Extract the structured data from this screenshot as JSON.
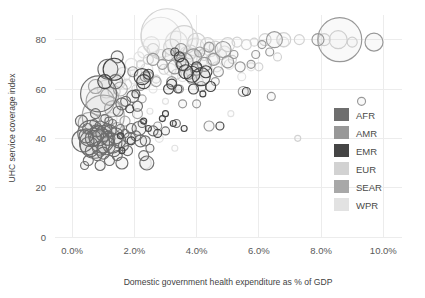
{
  "chart_data": {
    "type": "scatter",
    "title": "",
    "xlabel": "Domestic government health expenditure as % of GDP",
    "ylabel": "UHC service coverage index",
    "xlim": [
      -0.55,
      10.6
    ],
    "ylim": [
      0,
      90
    ],
    "xticks": [
      "0.0%",
      "2.0%",
      "4.0%",
      "6.0%",
      "8.0%",
      "10.0%"
    ],
    "xtick_values": [
      0,
      2,
      4,
      6,
      8,
      10
    ],
    "yticks": [
      "0",
      "20",
      "40",
      "60",
      "80"
    ],
    "ytick_values": [
      0,
      20,
      40,
      60,
      80
    ],
    "grid": true,
    "legend_position": "right-inside",
    "bubble_encoding": "population",
    "legend": [
      {
        "name": "AFR",
        "color": "#6e6e6e"
      },
      {
        "name": "AMR",
        "color": "#989898"
      },
      {
        "name": "EMR",
        "color": "#454545"
      },
      {
        "name": "EUR",
        "color": "#d2d2d2"
      },
      {
        "name": "SEAR",
        "color": "#a8a8a8"
      },
      {
        "name": "WPR",
        "color": "#e2e2e2"
      }
    ],
    "series": [
      {
        "name": "AFR",
        "color": "#6e6e6e",
        "points": [
          [
            0.35,
            39,
            11
          ],
          [
            0.45,
            41,
            7
          ],
          [
            0.5,
            44,
            5
          ],
          [
            0.55,
            37,
            9
          ],
          [
            0.6,
            42,
            13
          ],
          [
            0.62,
            35,
            6
          ],
          [
            0.68,
            40,
            8
          ],
          [
            0.7,
            46,
            4
          ],
          [
            0.72,
            38,
            15
          ],
          [
            0.78,
            43,
            6
          ],
          [
            0.8,
            33,
            5
          ],
          [
            0.85,
            41,
            10
          ],
          [
            0.88,
            36,
            7
          ],
          [
            0.9,
            45,
            5
          ],
          [
            0.95,
            39,
            12
          ],
          [
            1.0,
            34,
            6
          ],
          [
            1.02,
            42,
            8
          ],
          [
            1.05,
            48,
            4
          ],
          [
            1.1,
            37,
            9
          ],
          [
            1.12,
            44,
            5
          ],
          [
            1.15,
            40,
            7
          ],
          [
            1.2,
            31,
            5
          ],
          [
            1.22,
            43,
            6
          ],
          [
            1.28,
            38,
            10
          ],
          [
            1.3,
            46,
            4
          ],
          [
            1.35,
            35,
            6
          ],
          [
            1.4,
            41,
            8
          ],
          [
            1.45,
            33,
            5
          ],
          [
            1.5,
            39,
            7
          ],
          [
            1.55,
            44,
            4
          ],
          [
            1.6,
            30,
            6
          ],
          [
            1.65,
            37,
            5
          ],
          [
            1.7,
            42,
            4
          ],
          [
            1.78,
            35,
            5
          ],
          [
            1.85,
            40,
            6
          ],
          [
            0.4,
            29,
            4
          ],
          [
            0.52,
            31,
            5
          ],
          [
            0.9,
            29,
            5
          ],
          [
            1.18,
            47,
            4
          ],
          [
            0.3,
            47,
            6
          ],
          [
            0.75,
            50,
            5
          ],
          [
            1.48,
            51,
            5
          ],
          [
            1.6,
            54,
            6
          ],
          [
            1.72,
            55,
            5
          ],
          [
            1.9,
            44,
            5
          ],
          [
            2.05,
            41,
            5
          ],
          [
            2.15,
            44,
            7
          ],
          [
            2.2,
            39,
            6
          ],
          [
            2.25,
            46,
            4
          ],
          [
            2.3,
            33,
            5
          ],
          [
            2.4,
            30,
            7
          ],
          [
            2.1,
            53,
            5
          ],
          [
            1.95,
            57,
            6
          ],
          [
            1.4,
            63,
            7
          ],
          [
            0.85,
            58,
            18
          ],
          [
            1.15,
            68,
            10
          ],
          [
            1.45,
            73,
            6
          ],
          [
            2.6,
            43,
            5
          ],
          [
            3.0,
            43,
            4
          ],
          [
            3.35,
            46,
            4
          ],
          [
            2.35,
            39,
            5
          ],
          [
            2.5,
            36,
            4
          ]
        ]
      },
      {
        "name": "AMR",
        "color": "#989898",
        "points": [
          [
            2.6,
            72,
            6
          ],
          [
            2.9,
            70,
            5
          ],
          [
            3.1,
            74,
            6
          ],
          [
            3.3,
            69,
            7
          ],
          [
            3.5,
            76,
            6
          ],
          [
            3.6,
            71,
            9
          ],
          [
            3.75,
            66,
            5
          ],
          [
            3.9,
            73,
            8
          ],
          [
            4.0,
            68,
            6
          ],
          [
            4.1,
            75,
            5
          ],
          [
            4.25,
            70,
            7
          ],
          [
            4.4,
            77,
            5
          ],
          [
            4.55,
            72,
            6
          ],
          [
            4.7,
            67,
            5
          ],
          [
            4.85,
            76,
            8
          ],
          [
            5.0,
            71,
            6
          ],
          [
            5.2,
            74,
            4
          ],
          [
            5.4,
            69,
            5
          ],
          [
            2.35,
            65,
            5
          ],
          [
            2.2,
            61,
            4
          ],
          [
            3.2,
            63,
            5
          ],
          [
            3.45,
            60,
            4
          ],
          [
            4.6,
            63,
            4
          ],
          [
            4.15,
            61,
            5
          ],
          [
            6.5,
            80,
            8
          ],
          [
            7.9,
            80,
            6
          ],
          [
            8.6,
            80,
            22
          ],
          [
            9.7,
            79,
            9
          ],
          [
            6.1,
            78,
            4
          ],
          [
            5.9,
            74,
            4
          ],
          [
            6.35,
            75,
            4
          ],
          [
            5.75,
            70,
            4
          ],
          [
            1.95,
            67,
            5
          ],
          [
            2.75,
            45,
            4
          ],
          [
            3.55,
            54,
            4
          ],
          [
            4.4,
            45,
            5
          ],
          [
            4.0,
            54,
            4
          ],
          [
            5.5,
            59,
            5
          ],
          [
            6.4,
            57,
            4
          ],
          [
            9.3,
            55,
            4
          ]
        ]
      },
      {
        "name": "EMR",
        "color": "#454545",
        "points": [
          [
            1.05,
            63,
            7
          ],
          [
            1.35,
            68,
            11
          ],
          [
            2.25,
            65,
            8
          ],
          [
            2.3,
            63,
            7
          ],
          [
            2.45,
            66,
            5
          ],
          [
            3.3,
            75,
            4
          ],
          [
            3.45,
            73,
            5
          ],
          [
            3.55,
            70,
            6
          ],
          [
            3.65,
            67,
            7
          ],
          [
            3.85,
            66,
            8
          ],
          [
            4.0,
            69,
            5
          ],
          [
            4.15,
            65,
            9
          ],
          [
            4.3,
            67,
            6
          ],
          [
            3.2,
            62,
            5
          ],
          [
            3.1,
            60,
            5
          ],
          [
            3.4,
            60,
            4
          ],
          [
            2.05,
            58,
            4
          ],
          [
            1.85,
            52,
            4
          ],
          [
            2.3,
            47,
            3
          ],
          [
            2.45,
            44,
            3
          ],
          [
            3.25,
            46,
            3
          ],
          [
            2.75,
            42,
            4
          ],
          [
            4.75,
            45,
            4
          ],
          [
            5.6,
            59,
            4
          ],
          [
            3.0,
            50,
            3
          ],
          [
            1.55,
            41,
            3
          ],
          [
            1.9,
            39,
            4
          ],
          [
            1.6,
            35,
            3
          ],
          [
            4.45,
            61,
            5
          ],
          [
            4.2,
            58,
            3
          ],
          [
            3.9,
            60,
            5
          ],
          [
            2.9,
            48,
            3
          ],
          [
            3.6,
            44,
            3
          ]
        ]
      },
      {
        "name": "EUR",
        "color": "#d2d2d2",
        "points": [
          [
            3.05,
            82,
            26
          ],
          [
            3.6,
            80,
            14
          ],
          [
            4.0,
            79,
            9
          ],
          [
            4.35,
            78,
            7
          ],
          [
            4.6,
            77,
            6
          ],
          [
            5.0,
            78,
            7
          ],
          [
            5.3,
            79,
            5
          ],
          [
            5.6,
            78,
            5
          ],
          [
            5.85,
            79,
            4
          ],
          [
            6.2,
            80,
            6
          ],
          [
            6.8,
            80,
            7
          ],
          [
            7.3,
            80,
            5
          ],
          [
            8.1,
            80,
            6
          ],
          [
            8.55,
            80,
            9
          ],
          [
            9.0,
            79,
            5
          ],
          [
            2.6,
            76,
            6
          ],
          [
            2.85,
            74,
            5
          ],
          [
            3.2,
            77,
            8
          ],
          [
            3.4,
            73,
            6
          ],
          [
            4.8,
            74,
            5
          ],
          [
            4.5,
            72,
            6
          ],
          [
            2.45,
            72,
            5
          ],
          [
            2.2,
            70,
            4
          ],
          [
            5.15,
            72,
            4
          ],
          [
            4.25,
            74,
            6
          ],
          [
            3.8,
            75,
            7
          ],
          [
            2.95,
            68,
            5
          ],
          [
            3.35,
            66,
            5
          ],
          [
            2.7,
            64,
            4
          ],
          [
            6.0,
            69,
            4
          ],
          [
            6.6,
            73,
            4
          ],
          [
            7.25,
            40,
            3
          ],
          [
            2.05,
            60,
            4
          ],
          [
            1.75,
            62,
            5
          ],
          [
            1.35,
            59,
            6
          ]
        ]
      },
      {
        "name": "SEAR",
        "color": "#a8a8a8",
        "points": [
          [
            0.9,
            55,
            14
          ],
          [
            1.2,
            57,
            9
          ],
          [
            1.0,
            49,
            21
          ],
          [
            1.55,
            60,
            7
          ],
          [
            1.3,
            52,
            8
          ],
          [
            0.55,
            46,
            11
          ],
          [
            2.45,
            65,
            5
          ],
          [
            2.7,
            63,
            5
          ],
          [
            3.5,
            71,
            5
          ],
          [
            2.1,
            50,
            5
          ],
          [
            1.7,
            47,
            5
          ],
          [
            2.25,
            56,
            4
          ],
          [
            1.45,
            44,
            6
          ],
          [
            0.75,
            61,
            7
          ],
          [
            3.85,
            64,
            5
          ]
        ]
      },
      {
        "name": "WPR",
        "color": "#e2e2e2",
        "points": [
          [
            2.85,
            81,
            20
          ],
          [
            3.35,
            79,
            11
          ],
          [
            3.95,
            77,
            9
          ],
          [
            4.45,
            76,
            7
          ],
          [
            4.9,
            75,
            6
          ],
          [
            2.55,
            78,
            8
          ],
          [
            2.3,
            75,
            6
          ],
          [
            3.7,
            74,
            8
          ],
          [
            4.2,
            72,
            6
          ],
          [
            5.05,
            70,
            5
          ],
          [
            2.15,
            73,
            5
          ],
          [
            1.9,
            70,
            6
          ],
          [
            1.65,
            66,
            7
          ],
          [
            1.45,
            63,
            8
          ],
          [
            1.1,
            60,
            9
          ],
          [
            3.15,
            68,
            6
          ],
          [
            3.55,
            65,
            5
          ],
          [
            4.05,
            63,
            5
          ],
          [
            2.0,
            64,
            5
          ],
          [
            2.4,
            68,
            6
          ],
          [
            5.45,
            65,
            4
          ],
          [
            5.75,
            69,
            4
          ],
          [
            4.65,
            69,
            5
          ],
          [
            1.25,
            48,
            6
          ],
          [
            1.0,
            44,
            5
          ],
          [
            2.6,
            60,
            4
          ],
          [
            3.0,
            55,
            3
          ],
          [
            6.8,
            79,
            5
          ],
          [
            2.8,
            40,
            4
          ],
          [
            2.5,
            51,
            3
          ],
          [
            5.1,
            50,
            3
          ],
          [
            3.3,
            36,
            3
          ],
          [
            2.35,
            30,
            6
          ]
        ]
      }
    ]
  }
}
